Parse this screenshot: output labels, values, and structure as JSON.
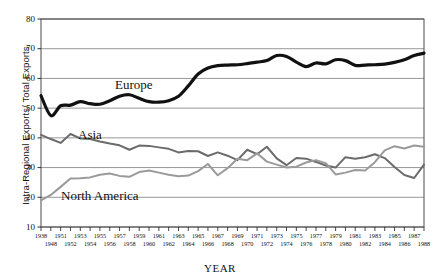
{
  "chart_data": {
    "type": "line",
    "title": "",
    "xlabel": "YEAR",
    "ylabel": "Intra-Regional Exports/ Total Exports",
    "ylim": [
      10,
      80
    ],
    "yticks": [
      10,
      20,
      30,
      40,
      50,
      60,
      70,
      80
    ],
    "grid": "horizontal",
    "legend": "inline-annotations",
    "x": [
      1938,
      1948,
      1951,
      1952,
      1953,
      1954,
      1955,
      1956,
      1957,
      1958,
      1959,
      1960,
      1961,
      1962,
      1963,
      1964,
      1965,
      1966,
      1967,
      1968,
      1969,
      1970,
      1971,
      1972,
      1973,
      1974,
      1975,
      1976,
      1977,
      1978,
      1979,
      1980,
      1981,
      1982,
      1983,
      1984,
      1985,
      1986,
      1987,
      1988
    ],
    "xtick_labels_top": [
      "1938",
      "1951",
      "1953",
      "1955",
      "1957",
      "1959",
      "1961",
      "1963",
      "1965",
      "1967",
      "1969",
      "1971",
      "1973",
      "1975",
      "1977",
      "1979",
      "1981",
      "1983",
      "1985",
      "1987"
    ],
    "xtick_labels_bottom": [
      "1948",
      "1952",
      "1954",
      "1956",
      "1958",
      "1960",
      "1962",
      "1964",
      "1966",
      "1968",
      "1970",
      "1972",
      "1974",
      "1976",
      "1978",
      "1980",
      "1982",
      "1984",
      "1986",
      "1988"
    ],
    "series": [
      {
        "name": "Europe",
        "color": "#111111",
        "values": [
          54.2,
          47.5,
          50.8,
          51.0,
          52.2,
          51.5,
          51.3,
          52.5,
          54.0,
          54.5,
          53.3,
          52.2,
          52.0,
          52.5,
          54.0,
          57.5,
          61.5,
          63.5,
          64.3,
          64.5,
          64.6,
          65.0,
          65.5,
          66.0,
          67.7,
          67.4,
          65.5,
          64.0,
          65.2,
          64.9,
          66.3,
          66.0,
          64.4,
          64.5,
          64.6,
          64.8,
          65.4,
          66.3,
          67.7,
          68.5
        ]
      },
      {
        "name": "Asia",
        "color": "#6b6b6b",
        "values": [
          41.0,
          39.6,
          38.3,
          41.3,
          39.8,
          39.6,
          38.8,
          38.1,
          37.5,
          36.0,
          37.4,
          37.3,
          36.8,
          36.3,
          35.1,
          35.6,
          35.5,
          33.9,
          35.1,
          34.0,
          32.5,
          36.0,
          34.5,
          37.0,
          33.1,
          30.8,
          33.2,
          33.0,
          31.9,
          30.7,
          30.0,
          33.5,
          33.0,
          33.5,
          34.5,
          33.2,
          30.2,
          27.5,
          26.5,
          31.0
        ]
      },
      {
        "name": "North America",
        "color": "#9a9a9a",
        "values": [
          19.0,
          20.8,
          23.5,
          26.3,
          26.4,
          26.7,
          27.6,
          28.0,
          27.2,
          26.9,
          28.5,
          29.0,
          28.3,
          27.6,
          27.1,
          27.3,
          28.8,
          31.2,
          27.4,
          29.8,
          33.0,
          32.5,
          34.8,
          32.0,
          31.0,
          30.0,
          30.3,
          31.7,
          32.5,
          31.5,
          27.7,
          28.3,
          29.2,
          29.0,
          31.8,
          35.8,
          37.2,
          36.4,
          37.4,
          37.0
        ]
      }
    ],
    "annotations": [
      {
        "text": "Europe",
        "series": "Europe"
      },
      {
        "text": "Asia",
        "series": "Asia"
      },
      {
        "text": "North America",
        "series": "North America"
      }
    ]
  }
}
